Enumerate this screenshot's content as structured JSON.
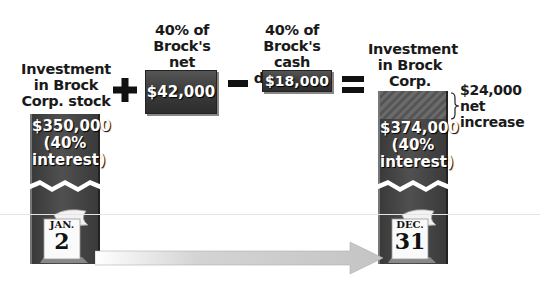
{
  "diagram": {
    "start_label": [
      "Investment",
      "in Brock",
      "Corp. stock"
    ],
    "plus_symbol": "+",
    "net_income_label": [
      "40% of",
      "Brock's net",
      "income"
    ],
    "net_income_value": "$42,000",
    "minus_symbol": "−",
    "dividends_label": [
      "40% of",
      "Brock's cash",
      "dividends"
    ],
    "dividends_value": "$18,000",
    "equals_symbol": "=",
    "end_label": [
      "Investment",
      "in Brock",
      "Corp. stock"
    ],
    "start_value": "$350,000",
    "start_interest": [
      "(40%",
      "interest)"
    ],
    "end_value": "$374,000",
    "end_interest": [
      "(40%",
      "interest)"
    ],
    "increase_value": "$24,000",
    "increase_label": [
      "net",
      "increase"
    ],
    "start_date": {
      "month": "JAN.",
      "day": "2"
    },
    "end_date": {
      "month": "DEC.",
      "day": "31"
    }
  },
  "colors": {
    "box_dark": "#3a3a3a",
    "arrow": "#c8c8c8",
    "hatch": "#6a6a6a"
  }
}
